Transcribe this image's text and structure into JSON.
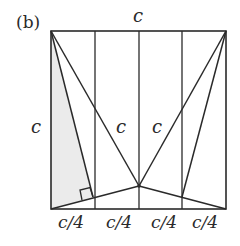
{
  "figure": {
    "panel_label": "(b)",
    "top_label": "c",
    "left_label": "c",
    "inner_left_label": "c",
    "inner_right_label": "c",
    "bottom_labels": [
      "c/4",
      "c/4",
      "c/4",
      "c/4"
    ]
  },
  "geometry": {
    "square": {
      "x0": 51,
      "y0": 31,
      "x1": 226,
      "y1": 209
    },
    "verticals_x": [
      95,
      139,
      182
    ],
    "apex": [
      139,
      186
    ],
    "foot_left": [
      93,
      197
    ],
    "foot_right": [
      182,
      197
    ]
  },
  "colors": {
    "stroke": "#2a2a2a",
    "shade": "#ebebeb",
    "background": "#ffffff"
  }
}
